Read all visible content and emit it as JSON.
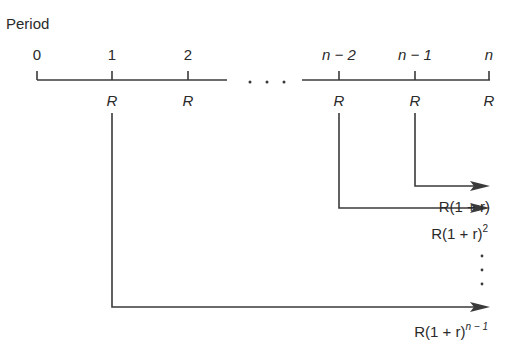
{
  "diagram": {
    "title": "Period",
    "period_labels": [
      "0",
      "1",
      "2",
      "n − 2",
      "n − 1",
      "n"
    ],
    "ellipsis": ". . .",
    "payment_label": "R",
    "payments_at_periods": [
      "1",
      "2",
      "n − 2",
      "n − 1",
      "n"
    ],
    "future_values": [
      {
        "from_period": "n − 1",
        "base": "R(1 + r)",
        "exponent": ""
      },
      {
        "from_period": "n − 2",
        "base": "R(1 + r)",
        "exponent": "2"
      },
      {
        "from_period": "1",
        "base": "R(1 + r)",
        "exponent": "n − 1"
      }
    ],
    "vertical_ellipsis": "⋮",
    "colors": {
      "line": "#3a3a3a",
      "text": "#2a2a2a",
      "background": "#ffffff"
    }
  }
}
